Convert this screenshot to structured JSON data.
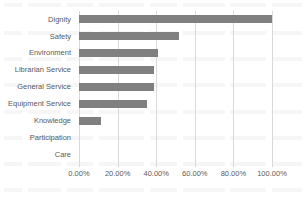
{
  "chart_data": {
    "type": "bar",
    "orientation": "horizontal",
    "title": "",
    "xlabel": "",
    "ylabel": "",
    "categories": [
      "Dignity",
      "Safety",
      "Environment",
      "Librarian Service",
      "General Service",
      "Equipment Service",
      "Knowledge",
      "Participation",
      "Care"
    ],
    "values": [
      100.0,
      52.0,
      41.0,
      39.0,
      39.0,
      35.0,
      11.5,
      0.0,
      0.0
    ],
    "value_suffix": "%",
    "xlim": [
      0,
      100
    ],
    "xticks": [
      0,
      20,
      40,
      60,
      80,
      100
    ],
    "xtick_labels": [
      "0.00%",
      "20.00%",
      "40.00%",
      "60.00%",
      "80.00%",
      "100.00%"
    ],
    "grid": "vertical",
    "legend": "none",
    "bar_color": "#808080",
    "gridline_color": "#D9D9D9",
    "text_color": "#5A5A5A"
  }
}
